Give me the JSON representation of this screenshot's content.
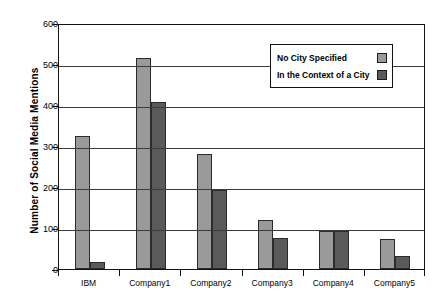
{
  "chart_data": {
    "type": "bar",
    "title": "",
    "xlabel": "",
    "ylabel": "Number of Social Media Mentions",
    "ylim": [
      0,
      600
    ],
    "ytick_step": 100,
    "yticks": [
      0,
      100,
      200,
      300,
      400,
      500,
      600
    ],
    "grid": true,
    "legend_position": "top-right-inside",
    "categories": [
      "IBM",
      "Company1",
      "Company2",
      "Company3",
      "Company4",
      "Company5"
    ],
    "series": [
      {
        "name": "No City Specified",
        "color": "#9a9a9a",
        "values": [
          325,
          515,
          280,
          120,
          92,
          72
        ]
      },
      {
        "name": "In the Context of a City",
        "color": "#5a5a5a",
        "values": [
          17,
          407,
          193,
          75,
          92,
          32
        ]
      }
    ]
  },
  "axis": {
    "y_title": "Number of Social Media Mentions",
    "tick_labels": [
      "600",
      "500",
      "400",
      "300",
      "200",
      "100",
      "0"
    ]
  },
  "legend": {
    "entries": [
      {
        "label": "No City Specified",
        "color": "#9a9a9a"
      },
      {
        "label": "In the Context of a City",
        "color": "#5a5a5a"
      }
    ]
  },
  "colors": {
    "series_light": "#9a9a9a",
    "series_dark": "#5a5a5a",
    "axis": "#111111",
    "grid": "#3b3b3b",
    "background": "#ffffff"
  }
}
